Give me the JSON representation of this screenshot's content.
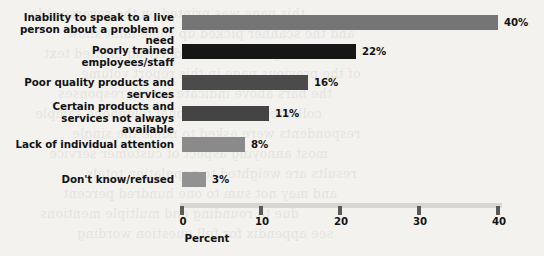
{
  "chart_data": {
    "type": "bar",
    "orientation": "horizontal",
    "title": "",
    "xlabel": "Percent",
    "ylabel": "",
    "xlim": [
      0,
      40
    ],
    "xticks": [
      0,
      10,
      20,
      30,
      40
    ],
    "xtick_labels": [
      "0",
      "10",
      "20",
      "30",
      "40"
    ],
    "grid": false,
    "legend": "none",
    "categories": [
      "Inability to speak to a live person about a problem or need",
      "Poorly trained employees/staff",
      "Poor quality products and services",
      "Certain products and services not always available",
      "Lack of individual attention",
      "Don't know/refused"
    ],
    "values": [
      40,
      22,
      16,
      11,
      8,
      3
    ],
    "value_labels": [
      "40%",
      "22%",
      "16%",
      "11%",
      "8%",
      "3%"
    ],
    "bar_colors": [
      "#757575",
      "#161616",
      "#4b4b4b",
      "#444444",
      "#8a8a8a",
      "#929292"
    ]
  },
  "labels": {
    "line0a": "Inability to speak to a live",
    "line0b": "person about a problem or need",
    "line1a": "Poorly trained employees/staff",
    "line1b": "",
    "line2a": "Poor quality products and services",
    "line2b": "",
    "line3a": "Certain products and",
    "line3b": "services not always available",
    "line4a": "Lack of individual attention",
    "line4b": "",
    "line5a": "Don't know/refused",
    "line5b": ""
  },
  "values": {
    "v0": "40%",
    "v1": "22%",
    "v2": "16%",
    "v3": "11%",
    "v4": "8%",
    "v5": "3%"
  },
  "axis": {
    "t0": "0",
    "t1": "10",
    "t2": "20",
    "t3": "30",
    "t4": "40",
    "title": "Percent"
  },
  "background": {
    "page_color": "#f3f2ee",
    "ghost_text": [
      "this page was printed on the reverse side",
      "and the scanner picked up some faint show",
      "through from the underlying printed text",
      "of the previous page in this report volume",
      "the bars above indicate survey responses",
      "collected from a national telephone sample",
      "respondents were asked to name the single",
      "most annoying aspect of customer service",
      "results are weighted to population totals",
      "and may not sum to one hundred percent",
      "due to rounding and multiple mentions",
      "see appendix for full question wording"
    ]
  }
}
